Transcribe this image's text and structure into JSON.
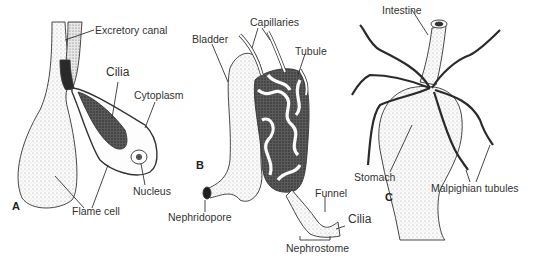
{
  "figure": {
    "panels": [
      {
        "letter": "A",
        "labels": {
          "excretory_canal": "Excretory canal",
          "cilia": "Cilia",
          "cytoplasm": "Cytoplasm",
          "nucleus": "Nucleus",
          "flame_cell": "Flame cell"
        }
      },
      {
        "letter": "B",
        "labels": {
          "bladder": "Bladder",
          "capillaries": "Capillaries",
          "tubule": "Tubule",
          "nephridopore": "Nephridopore",
          "funnel": "Funnel",
          "cilia": "Cilia",
          "nephrostome": "Nephrostome"
        }
      },
      {
        "letter": "C",
        "labels": {
          "intestine": "Intestine",
          "stomach": "Stomach",
          "malpighian_tubules": "Malpighian tubules"
        }
      }
    ]
  },
  "colors": {
    "ink": "#222222",
    "stipple": "#bdbdbd",
    "dark_fill": "#3a3a3a",
    "background": "#ffffff"
  }
}
